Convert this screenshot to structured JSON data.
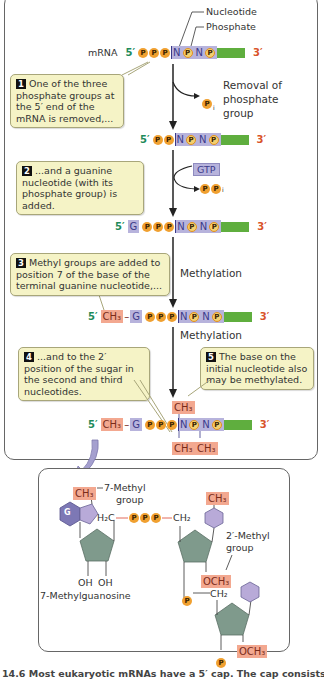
{
  "labels": {
    "nucleotide": "Nucleotide",
    "phosphate": "Phosphate",
    "mrna": "mRNA",
    "five_prime": "5′",
    "three_prime": "3′",
    "removal": "Removal of phosphate group",
    "removal_l1": "Removal of",
    "removal_l2": "phosphate",
    "removal_l3": "group",
    "gtp": "GTP",
    "ppi": "PP",
    "ppi_sub": "i",
    "pi": "P",
    "pi_sub": "i",
    "methylation1": "Methylation",
    "methylation2": "Methylation",
    "ch3": "CH₃",
    "g": "G",
    "n": "N",
    "p": "P"
  },
  "steps": [
    {
      "num": "1",
      "text": "One of the three phosphate groups at the 5′ end of the mRNA is removed,..."
    },
    {
      "num": "2",
      "text": "...and a guanine nucleotide (with its phosphate group) is added."
    },
    {
      "num": "3",
      "text": "Methyl groups are added to position 7 of the base of the terminal guanine nucleotide,..."
    },
    {
      "num": "4",
      "text": "...and to the 2′ position of the sugar in the second and third nucleotides."
    },
    {
      "num": "5",
      "text": "The base on the initial nucleotide also may be methylated."
    }
  ],
  "strands": [
    {
      "id": "initial",
      "prefix": "",
      "items": [
        "P",
        "P",
        "P",
        "N",
        "P",
        "N",
        "P"
      ]
    },
    {
      "id": "after_removal",
      "prefix": "",
      "items": [
        "P",
        "P",
        "N",
        "P",
        "N",
        "P"
      ]
    },
    {
      "id": "after_guanine",
      "prefix": "G",
      "items": [
        "P",
        "P",
        "P",
        "N",
        "P",
        "N",
        "P"
      ]
    },
    {
      "id": "after_methyl7",
      "prefix": "CH3-G",
      "items": [
        "P",
        "P",
        "P",
        "N",
        "P",
        "N",
        "P"
      ]
    },
    {
      "id": "final",
      "prefix": "CH3-G",
      "items": [
        "P",
        "P",
        "P",
        "N",
        "P",
        "N",
        "P"
      ]
    }
  ],
  "structure": {
    "methyl7_label_l1": "7-Methyl",
    "methyl7_label_l2": "group",
    "ch3": "CH₃",
    "h2c": "H₂C",
    "ch2": "CH₂",
    "och3": "OCH₃",
    "oh1": "OH",
    "oh2": "OH",
    "methylguanosine": "7-Methylguanosine",
    "methyl2_label_l1": "2′-Methyl",
    "methyl2_label_l2": "group",
    "g": "G",
    "p": "P"
  },
  "caption": "14.6  Most eukaryotic mRNAs have a 5′ cap. The cap consists of",
  "colors": {
    "phosphate": "#f0a030",
    "nucleotide": "#b7b3dc",
    "methyl": "#f3a890",
    "rna_body": "#5fae3e",
    "five_prime": "#1e8a5a",
    "three_prime": "#d9532a",
    "callout_bg": "#f5f3c6",
    "sugar": "#7f9a8c",
    "base": "#b8aad8"
  }
}
